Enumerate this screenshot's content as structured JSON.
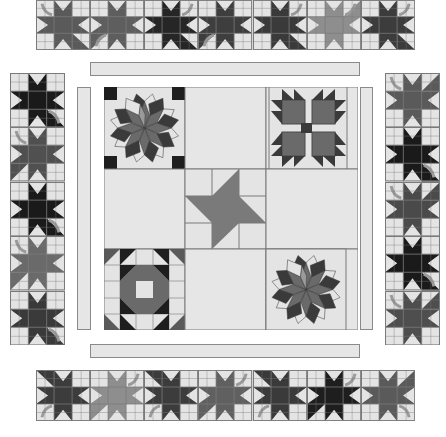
{
  "diagram": {
    "type": "quilt-layout",
    "colors": {
      "background": "#e4e4e4",
      "grid_line": "#7a7a7a",
      "sashing": "#e6e6e6",
      "leaf_dark": "#1e1e1e",
      "leaf_charcoal": "#3a3a3a",
      "leaf_medium": "#5a5a5a",
      "leaf_light": "#8e8e8e",
      "stem": "#9a9a9a"
    },
    "top_border": {
      "label": "Top maple leaf border",
      "blocks": [
        {
          "shade": "#5a5a5a",
          "stem": "top-left",
          "rot": 0
        },
        {
          "shade": "#5e5e5e",
          "stem": "bottom-left",
          "rot": 90
        },
        {
          "shade": "#262626",
          "stem": "top-right",
          "rot": 0
        },
        {
          "shade": "#3e3e3e",
          "stem": "bottom-left",
          "rot": 90
        },
        {
          "shade": "#3a3a3a",
          "stem": "top-right",
          "rot": 0
        },
        {
          "shade": "#8e8e8e",
          "stem": "top-right",
          "rot": 270
        },
        {
          "shade": "#3c3c3c",
          "stem": "top-right",
          "rot": 0
        }
      ]
    },
    "bottom_border": {
      "label": "Bottom maple leaf border",
      "blocks": [
        {
          "shade": "#3c3c3c",
          "stem": "bottom-left",
          "rot": 180
        },
        {
          "shade": "#8e8e8e",
          "stem": "top-right",
          "rot": 90
        },
        {
          "shade": "#3c3c3c",
          "stem": "bottom-left",
          "rot": 180
        },
        {
          "shade": "#606060",
          "stem": "top-right",
          "rot": 90
        },
        {
          "shade": "#3a3a3a",
          "stem": "bottom-left",
          "rot": 180
        },
        {
          "shade": "#1e1e1e",
          "stem": "top-right",
          "rot": 90
        },
        {
          "shade": "#5a5a5a",
          "stem": "bottom-right",
          "rot": 270
        }
      ]
    },
    "left_border": {
      "label": "Left maple leaf border",
      "blocks": [
        {
          "shade": "#1a1a1a",
          "stem": "bottom-right",
          "rot": 0
        },
        {
          "shade": "#505050",
          "stem": "top-left",
          "rot": 90
        },
        {
          "shade": "#1a1a1a",
          "stem": "bottom-right",
          "rot": 0
        },
        {
          "shade": "#6a6a6a",
          "stem": "top-left",
          "rot": 90
        },
        {
          "shade": "#3a3a3a",
          "stem": "bottom-right",
          "rot": 0
        }
      ]
    },
    "right_border": {
      "label": "Right maple leaf border",
      "blocks": [
        {
          "shade": "#5a5a5a",
          "stem": "top-left",
          "rot": 270
        },
        {
          "shade": "#1a1a1a",
          "stem": "bottom-right",
          "rot": 0
        },
        {
          "shade": "#4a4a4a",
          "stem": "top-left",
          "rot": 270
        },
        {
          "shade": "#1a1a1a",
          "stem": "bottom-right",
          "rot": 0
        },
        {
          "shade": "#4e4e4e",
          "stem": "top-left",
          "rot": 270
        }
      ]
    },
    "sashing": {
      "top": "Top sashing strip",
      "bottom": "Bottom sashing strip",
      "left": "Left sashing strip",
      "right": "Right sashing strip"
    },
    "center": {
      "label": "Center medallion",
      "blocks": {
        "top_left": "Eight-pointed star (Carpenter's Wheel)",
        "top_right": "Bear's Paw",
        "center": "Pinwheel star",
        "bottom_left": "Shoofly / Churn Dash variant",
        "bottom_right": "Eight-pointed star (Carpenter's Wheel)"
      }
    }
  }
}
